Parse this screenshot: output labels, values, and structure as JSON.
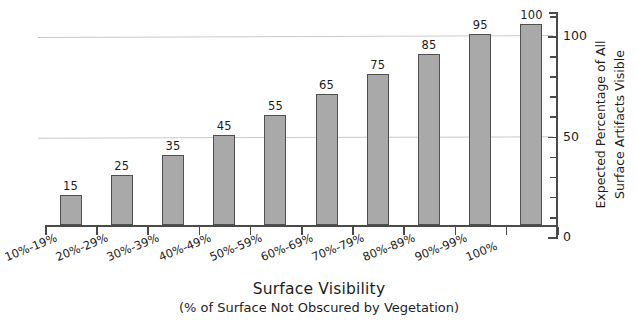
{
  "chart_data": {
    "type": "bar",
    "title": "",
    "xlabel": "Surface Visibility",
    "xlabel_sub": "(% of Surface Not Obscured by Vegetation)",
    "ylabel_line1": "Expected Percentage of All",
    "ylabel_line2": "Surface Artifacts Visible",
    "categories": [
      "10%-19%",
      "20%-29%",
      "30%-39%",
      "40%-49%",
      "50%-59%",
      "60%-69%",
      "70%-79%",
      "80%-89%",
      "90%-99%",
      "100%"
    ],
    "values": [
      15,
      25,
      35,
      45,
      55,
      65,
      75,
      85,
      95,
      100
    ],
    "value_labels": [
      "15",
      "25",
      "35",
      "45",
      "55",
      "65",
      "75",
      "85",
      "95",
      "100"
    ],
    "ylim": [
      0,
      112
    ],
    "y_tick_labels": [
      "0",
      "50",
      "100"
    ],
    "y_tick_values": [
      0,
      50,
      100
    ],
    "y_minor_tick_step": 10,
    "gridlines": [
      50,
      100
    ],
    "grid": true,
    "legend": "none",
    "axis_position": "right",
    "bar_fill_color": "#a9a9a9",
    "bar_edge_color": "#4f4f4f",
    "gridline_color": "#c9c9c9",
    "axis_color": "#4a4a4a",
    "text_color": "#1d1d1d",
    "background_color": "#ffffff"
  }
}
